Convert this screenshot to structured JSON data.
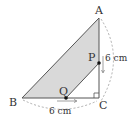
{
  "diagram": {
    "type": "geometry",
    "points": {
      "A": {
        "label": "A",
        "x": 99,
        "y": 18
      },
      "B": {
        "label": "B",
        "x": 22,
        "y": 98
      },
      "C": {
        "label": "C",
        "x": 99,
        "y": 98
      },
      "P": {
        "label": "P",
        "x": 99,
        "y": 63
      },
      "Q": {
        "label": "Q",
        "x": 66,
        "y": 98
      }
    },
    "measurements": {
      "AC": "6 cm",
      "BC": "6 cm"
    },
    "right_angle_at": "C",
    "shaded_region": "ABQP",
    "colors": {
      "shade": "#d9d9d9",
      "line": "#555555",
      "dashed": "#999999"
    }
  }
}
